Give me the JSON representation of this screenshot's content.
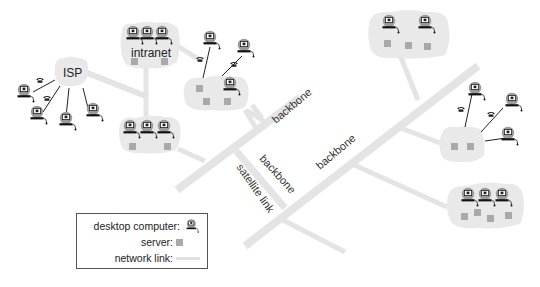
{
  "diagram": {
    "type": "network-topology",
    "colors": {
      "background": "#ffffff",
      "cloud_fill": "#e9e9e9",
      "network_link": "#e4e4e4",
      "server": "#a9a9a9",
      "line": "#222222",
      "text": "#333333"
    },
    "clouds": [
      {
        "id": "isp",
        "label": "ISP",
        "desktops": 0,
        "servers": 0
      },
      {
        "id": "intranet",
        "label": "intranet",
        "desktops": 3,
        "servers": 2
      },
      {
        "id": "dialup-hub-left",
        "label": "",
        "desktops": 1,
        "servers": 3
      },
      {
        "id": "lan-left-lower",
        "label": "",
        "desktops": 3,
        "servers": 2
      },
      {
        "id": "lan-top-right",
        "label": "",
        "desktops": 2,
        "servers": 3
      },
      {
        "id": "dialup-hub-right",
        "label": "",
        "desktops": 0,
        "servers": 2
      },
      {
        "id": "lan-bottom-right",
        "label": "",
        "desktops": 3,
        "servers": 4
      }
    ],
    "link_labels": {
      "backbone_1": "backbone",
      "backbone_2": "backbone",
      "backbone_3": "backbone",
      "satellite": "satellite link"
    },
    "dialup_phone_icon": "telephone-icon",
    "legend": {
      "desktop": "desktop computer:",
      "server": "server:",
      "link": "network link:"
    }
  }
}
